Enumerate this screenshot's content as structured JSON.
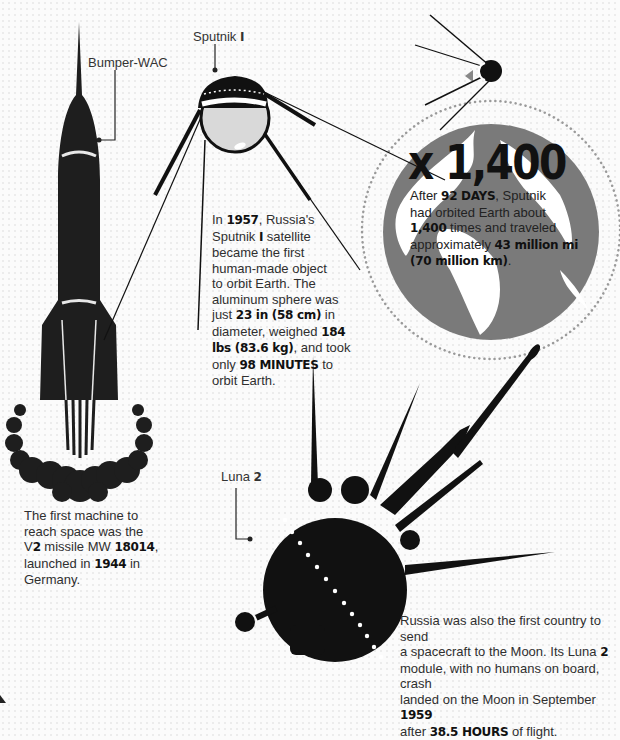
{
  "labels": {
    "bumper": "Bumper-WAC",
    "sputnik_prefix": "Sputnik ",
    "sputnik_num": "I",
    "luna_prefix": "Luna ",
    "luna_num": "2"
  },
  "earth_stat": {
    "big_number": "x 1,400",
    "line1_pre": "After ",
    "line1_bold": "92 DAYS",
    "line1_post": ", Sputnik",
    "line2": "had orbited Earth about",
    "line3_bold": "1,400",
    "line3_post": " times and traveled",
    "line4_pre": "approximately ",
    "line4_bold": "43 million mi",
    "line5_bold": "(70 million km)",
    "line5_post": "."
  },
  "sputnik_text": {
    "l1_pre": "In ",
    "l1_bold": "1957",
    "l1_post": ", Russia's",
    "l2_pre": "Sputnik ",
    "l2_bold": "I",
    "l2_post": " satellite",
    "l3": "became the first",
    "l4": "human-made object",
    "l5": "to orbit Earth. The",
    "l6": "aluminum sphere was",
    "l7_pre": "just ",
    "l7_bold": "23 in (58 cm)",
    "l7_post": " in",
    "l8_pre": "diameter, weighed ",
    "l8_bold": "184",
    "l9_bold": "lbs (83.6 kg)",
    "l9_post": ", and took",
    "l10_pre": "only ",
    "l10_bold": "98 MINUTES",
    "l10_post": " to",
    "l11": "orbit Earth."
  },
  "v2_text": {
    "l1": "The first machine to",
    "l2": "reach space was the",
    "l3_pre": "V",
    "l3_bold": "2",
    "l3_mid": " missile MW ",
    "l3_bold2": "18014",
    "l3_post": ",",
    "l4_pre": "launched in ",
    "l4_bold": "1944",
    "l4_post": " in",
    "l5": "Germany."
  },
  "luna_text": {
    "l1": "Russia was also the first country to send",
    "l2_pre": "a spacecraft to the Moon. Its Luna ",
    "l2_bold": "2",
    "l3": "module, with no humans on board, crash",
    "l4_pre": "landed on the Moon in September ",
    "l4_bold": "1959",
    "l5_pre": "after ",
    "l5_bold": "38.5 HOURS",
    "l5_post": " of flight."
  },
  "colors": {
    "ink": "#111111",
    "earth": "#7a7a7a",
    "sphere": "#d9d9d9",
    "orbit_dots": "#9a9a9a"
  }
}
